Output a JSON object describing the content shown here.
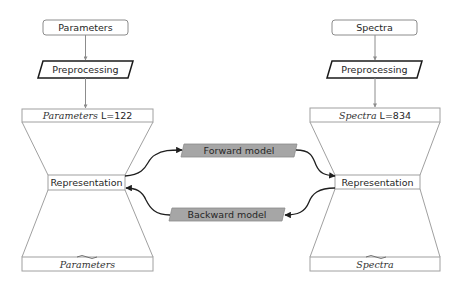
{
  "left_column": {
    "input_label": "Parameters",
    "preprocessing_label": "Preprocessing",
    "top_bar": {
      "italic": "Parameters",
      "suffix": " L=122"
    },
    "representation_label": "Representation",
    "bottom_bar": {
      "italic": "Parameters",
      "hat": "~"
    }
  },
  "right_column": {
    "input_label": "Spectra",
    "preprocessing_label": "Preprocessing",
    "top_bar": {
      "italic": "Spectra",
      "suffix": " L=834"
    },
    "representation_label": "Representation",
    "bottom_bar": {
      "italic": "Spectra",
      "hat": "~"
    }
  },
  "models": {
    "forward_label": "Forward model",
    "backward_label": "Backward model",
    "fill_color": "#a6a6a6"
  },
  "colors": {
    "box_stroke": "#8c8c8c",
    "line_stroke": "#a0a0a0",
    "arrow_stroke": "#1f1f1f",
    "parallelogram_stroke": "#1a1a1a"
  }
}
